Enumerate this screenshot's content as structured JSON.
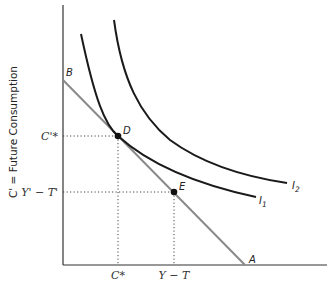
{
  "diagram": {
    "type": "intertemporal-consumption-indifference",
    "y_axis_label": "C' = Future Consumption",
    "x_axis_label": "",
    "y_ticks": {
      "c_prime_star": "C'*",
      "y_prime_minus_t_prime": "Y' − T'"
    },
    "x_ticks": {
      "c_star": "C*",
      "y_minus_t": "Y − T"
    },
    "points": {
      "B": "B",
      "D": "D",
      "E": "E",
      "A": "A"
    },
    "curves": {
      "I1": {
        "label": "I",
        "sub": "1"
      },
      "I2": {
        "label": "I",
        "sub": "2"
      }
    },
    "budget_line": {
      "from": "B",
      "to": "A",
      "color": "#8a8a8a"
    },
    "colors": {
      "axis": "#333333",
      "indifference": "#1a1a1a",
      "budget": "#8a8a8a",
      "dotted": "#444444"
    }
  }
}
